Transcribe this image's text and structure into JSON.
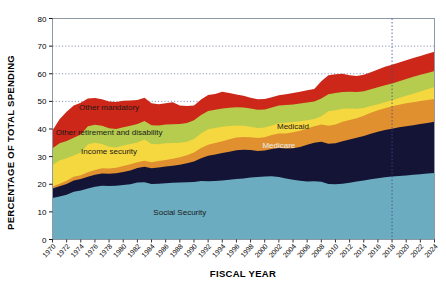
{
  "chart_data": {
    "type": "area",
    "title": "",
    "xlabel": "FISCAL YEAR",
    "ylabel": "PERCENTAGE OF TOTAL SPENDING",
    "ylim": [
      0,
      80
    ],
    "yticks": [
      0,
      10,
      20,
      30,
      40,
      50,
      60,
      70,
      80
    ],
    "grid": "horizontal-dotted",
    "legend": "inline-annotations",
    "stacked": true,
    "projection_marker_year": 2018,
    "x": [
      1970,
      1971,
      1972,
      1973,
      1974,
      1975,
      1976,
      1977,
      1978,
      1979,
      1980,
      1981,
      1982,
      1983,
      1984,
      1985,
      1986,
      1987,
      1988,
      1989,
      1990,
      1991,
      1992,
      1993,
      1994,
      1995,
      1996,
      1997,
      1998,
      1999,
      2000,
      2001,
      2002,
      2003,
      2004,
      2005,
      2006,
      2007,
      2008,
      2009,
      2010,
      2011,
      2012,
      2013,
      2014,
      2015,
      2016,
      2017,
      2018,
      2019,
      2020,
      2021,
      2022,
      2023,
      2024
    ],
    "xtick_labels": [
      "1970",
      "1972",
      "1974",
      "1976",
      "1978",
      "1980",
      "1982",
      "1984",
      "1986",
      "1988",
      "1990",
      "1992",
      "1994",
      "1996",
      "1998",
      "2000",
      "2002",
      "2004",
      "2006",
      "2008",
      "2010",
      "2012",
      "2014",
      "2016",
      "2018",
      "2020",
      "2022",
      "2024"
    ],
    "series": [
      {
        "name": "Social Security",
        "color": "#6cacc0",
        "label_x": 1988,
        "label_y": 9,
        "label_color": "dark",
        "values": [
          15.0,
          15.6,
          16.2,
          17.3,
          17.7,
          18.5,
          19.1,
          19.5,
          19.4,
          19.5,
          19.7,
          20.0,
          20.6,
          20.7,
          20.1,
          20.2,
          20.4,
          20.5,
          20.6,
          20.7,
          20.8,
          21.2,
          21.1,
          21.2,
          21.4,
          21.6,
          21.9,
          22.1,
          22.4,
          22.6,
          22.8,
          22.9,
          22.6,
          22.1,
          21.6,
          21.3,
          21.0,
          21.1,
          20.9,
          20.1,
          20.0,
          20.2,
          20.5,
          21.0,
          21.4,
          21.8,
          22.2,
          22.5,
          22.8,
          23.0,
          23.2,
          23.4,
          23.6,
          23.9,
          24.1
        ]
      },
      {
        "name": "Medicare",
        "color": "#141436",
        "label_x": 2002,
        "label_y": 33,
        "label_color": "light",
        "values": [
          0.0,
          0.0,
          0.0,
          0.0,
          0.0,
          0.0,
          0.0,
          0.0,
          0.0,
          0.0,
          0.0,
          0.0,
          0.0,
          0.0,
          0.0,
          0.0,
          0.0,
          0.0,
          0.0,
          0.0,
          0.0,
          0.0,
          0.0,
          0.0,
          0.0,
          0.0,
          0.0,
          0.0,
          0.0,
          0.0,
          0.0,
          0.0,
          0.0,
          0.0,
          0.0,
          0.0,
          0.0,
          0.0,
          0.0,
          0.0,
          0.0,
          0.0,
          0.0,
          0.0,
          0.0,
          0.0,
          0.0,
          0.0,
          0.0,
          0.0,
          0.0,
          0.0,
          0.0,
          0.0,
          0.0
        ],
        "cumulative": [
          18.5,
          19.3,
          20.1,
          21.4,
          21.9,
          22.7,
          23.4,
          23.9,
          23.8,
          24.0,
          24.4,
          25.0,
          25.9,
          26.3,
          25.8,
          26.1,
          26.4,
          26.7,
          27.1,
          27.6,
          28.2,
          29.4,
          30.3,
          30.8,
          31.3,
          31.8,
          32.3,
          32.5,
          32.4,
          32.0,
          32.2,
          32.8,
          33.1,
          32.9,
          33.0,
          33.5,
          34.3,
          35.0,
          35.4,
          34.7,
          34.8,
          35.6,
          36.2,
          36.8,
          37.5,
          38.3,
          39.0,
          39.6,
          40.1,
          40.6,
          41.0,
          41.4,
          41.8,
          42.2,
          42.6
        ]
      },
      {
        "name": "Medicaid",
        "color": "#e0902f",
        "label_x": 2004,
        "label_y": 40,
        "label_color": "dark",
        "cumulative": [
          19.2,
          20.2,
          21.3,
          22.7,
          23.3,
          24.3,
          25.2,
          25.8,
          25.7,
          26.0,
          26.6,
          27.2,
          28.0,
          28.5,
          28.0,
          28.4,
          28.8,
          29.2,
          29.8,
          30.5,
          31.5,
          33.1,
          34.3,
          34.9,
          35.6,
          36.3,
          36.9,
          37.1,
          37.0,
          36.7,
          37.0,
          37.8,
          38.4,
          38.4,
          38.8,
          39.4,
          40.2,
          41.0,
          41.6,
          41.2,
          41.6,
          42.6,
          43.3,
          43.9,
          44.8,
          45.9,
          46.8,
          47.5,
          48.2,
          48.8,
          49.3,
          49.7,
          50.1,
          50.5,
          50.9
        ]
      },
      {
        "name": "Income security",
        "color": "#f5d73f",
        "label_x": 1978,
        "label_y": 31,
        "label_color": "dark",
        "cumulative": [
          27.0,
          28.6,
          29.4,
          30.4,
          31.5,
          34.5,
          35.0,
          34.6,
          33.6,
          33.3,
          34.0,
          34.6,
          35.1,
          36.2,
          34.6,
          34.5,
          34.8,
          34.9,
          35.0,
          35.4,
          36.4,
          38.4,
          39.9,
          40.4,
          40.8,
          41.1,
          41.3,
          41.2,
          40.8,
          40.4,
          40.5,
          41.3,
          42.1,
          42.3,
          42.5,
          42.8,
          43.2,
          43.6,
          44.6,
          46.4,
          46.8,
          47.3,
          47.4,
          47.3,
          47.6,
          48.3,
          49.0,
          49.7,
          50.4,
          51.2,
          52.0,
          52.8,
          53.6,
          54.4,
          55.2
        ]
      },
      {
        "name": "Other retirement and disability",
        "color": "#b5cc4e",
        "label_x": 1978,
        "label_y": 38,
        "label_color": "dark",
        "cumulative": [
          33.0,
          34.8,
          35.7,
          36.8,
          38.0,
          41.0,
          41.5,
          41.2,
          40.3,
          40.0,
          40.6,
          41.2,
          41.8,
          42.9,
          41.4,
          41.3,
          41.6,
          41.7,
          41.8,
          42.2,
          43.2,
          45.1,
          46.5,
          47.0,
          47.4,
          47.7,
          47.9,
          47.8,
          47.4,
          47.0,
          47.1,
          47.8,
          48.5,
          48.7,
          48.9,
          49.2,
          49.6,
          50.0,
          51.0,
          52.6,
          53.0,
          53.4,
          53.5,
          53.4,
          53.7,
          54.4,
          55.1,
          55.8,
          56.5,
          57.3,
          58.1,
          58.9,
          59.6,
          60.3,
          61.0
        ]
      },
      {
        "name": "Other mandatory",
        "color": "#cc2718",
        "label_x": 1978,
        "label_y": 47,
        "label_color": "dark",
        "cumulative": [
          39.5,
          43.5,
          46.2,
          48.5,
          49.5,
          51.0,
          51.2,
          50.8,
          50.0,
          49.8,
          50.2,
          50.3,
          50.5,
          51.3,
          49.3,
          49.0,
          49.3,
          49.7,
          48.5,
          48.3,
          48.5,
          50.7,
          52.3,
          52.7,
          53.5,
          53.0,
          52.5,
          52.0,
          51.3,
          50.8,
          50.9,
          51.5,
          52.2,
          52.6,
          53.0,
          53.5,
          54.0,
          54.5,
          57.3,
          59.5,
          59.8,
          60.0,
          59.5,
          59.2,
          59.6,
          60.5,
          61.5,
          62.5,
          63.3,
          64.1,
          64.9,
          65.7,
          66.4,
          67.2,
          68.0
        ]
      }
    ]
  },
  "axes": {
    "y_min_label": "0",
    "y_max_label": "80"
  }
}
